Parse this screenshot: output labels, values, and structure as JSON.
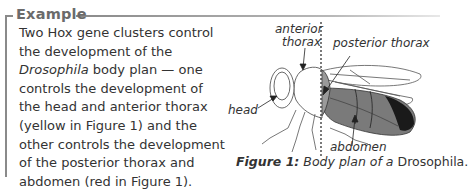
{
  "box": {
    "title": "Example",
    "body_lines": [
      {
        "text": "Two Hox gene clusters control"
      },
      {
        "text": "the development of the"
      },
      {
        "italic": "Drosophila",
        "text": " body plan — one"
      },
      {
        "text": "controls the development of"
      },
      {
        "text": "the head and anterior thorax"
      },
      {
        "text": "(yellow in Figure 1) and the"
      },
      {
        "text": "other controls the development"
      },
      {
        "text": "of the posterior thorax and"
      },
      {
        "text": "abdomen (red in Figure 1)."
      }
    ]
  },
  "figure": {
    "labels": {
      "anterior_1": "anterior",
      "anterior_2": "thorax",
      "posterior": "posterior thorax",
      "head": "head",
      "abdomen": "abdomen"
    },
    "caption_label": "Figure 1:",
    "caption_text": " Body plan of a ",
    "caption_species": "Drosophila."
  },
  "colors": {
    "frame": "#8a8a8a",
    "title": "#6b6b6b",
    "posterior_fill": "#8c8c8c",
    "abdomen_fill": "#7a7a7a",
    "abdomen_tip": "#1a1a1a"
  }
}
